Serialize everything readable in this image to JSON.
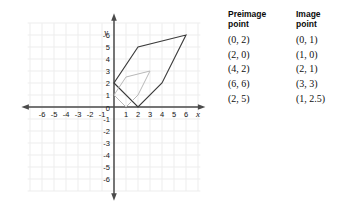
{
  "graph": {
    "x_axis": {
      "label": "x",
      "min": -6,
      "max": 6,
      "ticks": [
        -6,
        -5,
        -4,
        -3,
        -2,
        -1,
        1,
        2,
        3,
        4,
        5,
        6
      ]
    },
    "y_axis": {
      "label": "y",
      "min": -6,
      "max": 6,
      "ticks": [
        6,
        5,
        4,
        3,
        2,
        1,
        -1,
        -2,
        -3,
        -4,
        -5,
        -6
      ]
    },
    "origin_label": "0",
    "grid": true,
    "colors": {
      "preimage_stroke": "#3a3a3a",
      "image_stroke": "#b9b9b9",
      "axis": "#4a4a4a",
      "grid": "#ededed"
    }
  },
  "chart_data": {
    "type": "scatter",
    "title": "",
    "xlabel": "x",
    "ylabel": "y",
    "xlim": [
      -6,
      6
    ],
    "ylim": [
      -6,
      6
    ],
    "grid": true,
    "series": [
      {
        "name": "Preimage point",
        "color": "#3a3a3a",
        "points": [
          [
            0,
            2
          ],
          [
            2,
            0
          ],
          [
            4,
            2
          ],
          [
            6,
            6
          ],
          [
            2,
            5
          ]
        ]
      },
      {
        "name": "Image point",
        "color": "#b9b9b9",
        "points": [
          [
            0,
            1
          ],
          [
            1,
            0
          ],
          [
            2,
            1
          ],
          [
            3,
            3
          ],
          [
            1,
            2.5
          ]
        ]
      }
    ]
  },
  "table": {
    "headers": {
      "preimage": "Preimage\npoint",
      "image": "Image\npoint"
    },
    "rows": [
      {
        "preimage": "(0, 2)",
        "image": "(0, 1)"
      },
      {
        "preimage": "(2, 0)",
        "image": "(1, 0)"
      },
      {
        "preimage": "(4, 2)",
        "image": "(2, 1)"
      },
      {
        "preimage": "(6, 6)",
        "image": "(3, 3)"
      },
      {
        "preimage": "(2, 5)",
        "image": "(1, 2.5)"
      }
    ]
  }
}
